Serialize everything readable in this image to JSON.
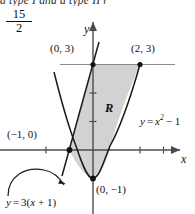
{
  "page": {
    "clipped_header_text": "a type I and a type II r",
    "stray_fraction": {
      "numerator": "15",
      "denominator": "2"
    }
  },
  "figure": {
    "axes": {
      "x_label": "x",
      "y_label": "y",
      "x_ticks": [
        -2,
        -1,
        1,
        2,
        3
      ],
      "y_ticks": [
        1,
        2,
        3
      ],
      "x_range": [
        -2.6,
        3.4
      ],
      "y_range": [
        -1.9,
        3.9
      ],
      "origin_px": {
        "x": 93,
        "y": 150
      },
      "unit_px": {
        "x": 23.5,
        "y": 28.5
      },
      "grid": false,
      "axis_color": "#4b4b4b"
    },
    "region": {
      "label": "R",
      "fill_color": "#d2d2d2",
      "description": "region bounded above-left by the line and below-right by the parabola"
    },
    "curves": [
      {
        "name": "parabola",
        "label": "y = x² − 1",
        "label_parts": {
          "lhs": "y",
          "eq": "=",
          "base": "x",
          "exponent": "2",
          "tail": "− 1"
        }
      },
      {
        "name": "line",
        "label": "y = 3(x + 1)",
        "label_parts": {
          "lhs": "y",
          "eq": "=",
          "rhs": "3(x + 1)"
        }
      }
    ],
    "points": [
      {
        "name": "upper-left-intersection",
        "label": "(0, 3)",
        "x": 0,
        "y": 3
      },
      {
        "name": "upper-right-intersection",
        "label": "(2, 3)",
        "x": 2,
        "y": 3
      },
      {
        "name": "left-intersection",
        "label": "(−1, 0)",
        "x": -1,
        "y": 0
      },
      {
        "name": "parabola-vertex",
        "label": "(0, −1)",
        "x": 0,
        "y": -1
      }
    ],
    "stroke_color": "#1a1a1a"
  }
}
